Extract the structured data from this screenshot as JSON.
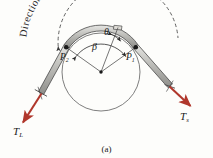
{
  "figure": {
    "caption": "(a)",
    "slipping_label": "Direction of impending slipping",
    "angle_theta": "θ",
    "angle_beta": "β",
    "point_left": "P",
    "point_left_sub": "2",
    "point_right": "P",
    "point_right_sub": "1",
    "tension_left": "T",
    "tension_left_sub": "L",
    "tension_right": "T",
    "tension_right_sub": "s"
  },
  "colors": {
    "tension_arrow": "#b0372c",
    "belt_fill": "#b9b9b6",
    "belt_stroke": "#4a4a4a",
    "drum_stroke": "#6b6b6b",
    "line_stroke": "#4a4a4a",
    "text": "#1a1a1a",
    "background": "#fdfdfb"
  },
  "geometry": {
    "drum_center_x": 101,
    "drum_center_y": 72,
    "drum_radius": 39,
    "point_left_x": 66,
    "point_left_y": 48,
    "point_right_x": 136,
    "point_right_y": 48
  }
}
